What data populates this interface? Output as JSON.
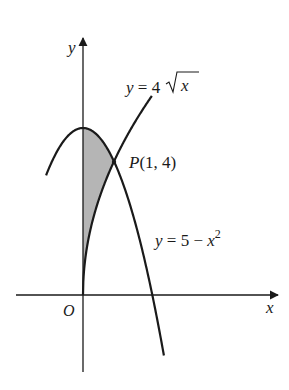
{
  "diagram": {
    "axes": {
      "x_label": "x",
      "y_label": "y",
      "origin_label": "O"
    },
    "curves": [
      {
        "name": "sqrt-curve",
        "label_prefix": "y = 4",
        "label_radicand": "x"
      },
      {
        "name": "parabola",
        "label_main": "y = 5 − x",
        "label_exp": "2"
      }
    ],
    "point": {
      "label": "P(1, 4)",
      "x": 1,
      "y": 4
    },
    "shaded_region": {
      "description": "Region between y-axis, y = 5 - x^2 (top) and y = 4√x (bottom), from x = 0 to x = 1",
      "color": "#b5b5b5"
    },
    "colors": {
      "stroke": "#1a1a1a",
      "shade": "#b5b5b5"
    }
  }
}
